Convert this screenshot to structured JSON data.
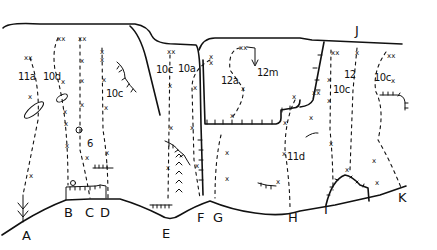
{
  "diagram": {
    "type": "climbing-topo",
    "background": "#ffffff",
    "ink": "#111111",
    "start_labels": [
      {
        "id": "A",
        "x": 22,
        "y": 240
      },
      {
        "id": "B",
        "x": 64,
        "y": 217
      },
      {
        "id": "C",
        "x": 85,
        "y": 217
      },
      {
        "id": "D",
        "x": 100,
        "y": 217
      },
      {
        "id": "E",
        "x": 162,
        "y": 238
      },
      {
        "id": "F",
        "x": 197,
        "y": 222
      },
      {
        "id": "G",
        "x": 213,
        "y": 222
      },
      {
        "id": "H",
        "x": 288,
        "y": 222
      },
      {
        "id": "I",
        "x": 324,
        "y": 214
      },
      {
        "id": "J",
        "x": 355,
        "y": 35
      },
      {
        "id": "K",
        "x": 398,
        "y": 202
      }
    ],
    "grades": [
      {
        "text": "11a",
        "x": 18,
        "y": 80
      },
      {
        "text": "10d",
        "x": 43,
        "y": 80
      },
      {
        "text": "10c",
        "x": 106,
        "y": 97
      },
      {
        "text": "6",
        "x": 87,
        "y": 147
      },
      {
        "text": "10c",
        "x": 156,
        "y": 73
      },
      {
        "text": "10a",
        "x": 178,
        "y": 72
      },
      {
        "text": "12a",
        "x": 221,
        "y": 84
      },
      {
        "text": "12m",
        "x": 257,
        "y": 76
      },
      {
        "text": "11d",
        "x": 287,
        "y": 160
      },
      {
        "text": "12",
        "x": 344,
        "y": 78
      },
      {
        "text": "10c",
        "x": 333,
        "y": 93
      },
      {
        "text": "10c",
        "x": 374,
        "y": 81
      }
    ]
  }
}
